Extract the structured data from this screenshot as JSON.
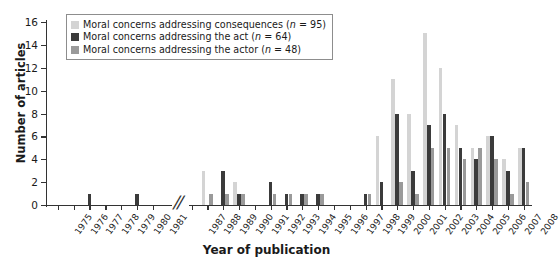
{
  "chart_data": {
    "type": "bar",
    "title": "",
    "xlabel": "Year of publication",
    "ylabel": "Number of articles",
    "ylim": [
      0,
      16
    ],
    "ytick_values": [
      0,
      2,
      4,
      6,
      8,
      10,
      12,
      14,
      16
    ],
    "ytick_labels": [
      "0",
      "2",
      "4",
      "6",
      "8",
      "10",
      "12",
      "14",
      "16"
    ],
    "grid": false,
    "legend_position": "top-left-inside",
    "axis_break": {
      "after": "1981",
      "before": "1987",
      "marker": "//"
    },
    "categories": [
      "1975",
      "1976",
      "1977",
      "1978",
      "1979",
      "1980",
      "1981",
      "1987",
      "1988",
      "1989",
      "1990",
      "1991",
      "1992",
      "1993",
      "1994",
      "1995",
      "1996",
      "1997",
      "1998",
      "1999",
      "2000",
      "2001",
      "2002",
      "2003",
      "2004",
      "2005",
      "2006",
      "2007",
      "2008"
    ],
    "series": [
      {
        "name": "Moral concerns addressing consequences",
        "n": 95,
        "color": "#d4d4d4",
        "values": [
          0,
          0,
          0,
          0,
          0,
          0,
          0,
          0,
          3,
          0,
          2,
          0,
          0,
          0,
          0,
          0,
          0,
          0,
          0,
          6,
          11,
          8,
          15,
          12,
          7,
          5,
          6,
          4,
          5
        ]
      },
      {
        "name": "Moral concerns addressing the act",
        "n": 64,
        "color": "#3b3b3b",
        "values": [
          0,
          0,
          1,
          0,
          0,
          1,
          0,
          0,
          0,
          3,
          1,
          0,
          2,
          1,
          1,
          1,
          0,
          0,
          1,
          2,
          8,
          3,
          7,
          8,
          5,
          4,
          6,
          3,
          5
        ]
      },
      {
        "name": "Moral concerns addressing the actor",
        "n": 48,
        "color": "#9a9a9a",
        "values": [
          0,
          0,
          0,
          0,
          0,
          0,
          0,
          0,
          1,
          1,
          1,
          0,
          1,
          1,
          1,
          1,
          0,
          0,
          1,
          0,
          2,
          1,
          5,
          5,
          4,
          5,
          4,
          1,
          2
        ]
      }
    ]
  },
  "legend": {
    "items": [
      {
        "label_prefix": "Moral concerns addressing consequences",
        "n_text": "(n = 95)",
        "swatch": "#d4d4d4"
      },
      {
        "label_prefix": "Moral concerns addressing the act",
        "n_text": "(n = 64)",
        "swatch": "#3b3b3b"
      },
      {
        "label_prefix": "Moral concerns addressing the actor",
        "n_text": "(n = 48)",
        "swatch": "#9a9a9a"
      }
    ]
  },
  "axes": {
    "y_title": "Number of articles",
    "x_title": "Year of publication",
    "break_marker": "//"
  }
}
